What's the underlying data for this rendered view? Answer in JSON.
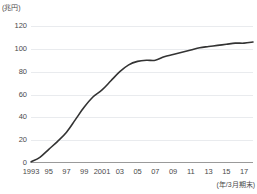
{
  "chart_data": {
    "type": "line",
    "title": "",
    "subtitle": "",
    "xlabel": "(年/3月期末)",
    "ylabel": "(兆円)",
    "unit_label": "(兆円)",
    "x_axis_note": "(年/3月期末)",
    "grid": true,
    "legend_position": "none",
    "xlim": [
      1993,
      2018
    ],
    "ylim": [
      0,
      120
    ],
    "y_ticks": [
      120,
      100,
      80,
      60,
      40,
      20,
      0
    ],
    "y_tick_labels": [
      "120",
      "100",
      "80",
      "60",
      "40",
      "20",
      "0"
    ],
    "x_ticks": [
      1993,
      1995,
      1997,
      1999,
      2001,
      2003,
      2005,
      2007,
      2009,
      2011,
      2013,
      2015,
      2017
    ],
    "x_tick_labels": [
      "1993",
      "95",
      "97",
      "99",
      "2001",
      "03",
      "05",
      "07",
      "09",
      "11",
      "13",
      "15",
      "17"
    ],
    "series": [
      {
        "name": "残高",
        "color": "#333333",
        "x": [
          1993,
          1994,
          1995,
          1996,
          1997,
          1998,
          1999,
          2000,
          2001,
          2002,
          2003,
          2004,
          2005,
          2006,
          2007,
          2008,
          2009,
          2010,
          2011,
          2012,
          2013,
          2014,
          2015,
          2016,
          2017,
          2018
        ],
        "values": [
          1,
          5,
          12,
          19,
          27,
          38,
          49,
          58,
          64,
          72,
          80,
          86,
          89,
          90,
          90,
          93,
          95,
          97,
          99,
          101,
          102,
          103,
          104,
          105,
          105,
          106
        ]
      }
    ]
  }
}
